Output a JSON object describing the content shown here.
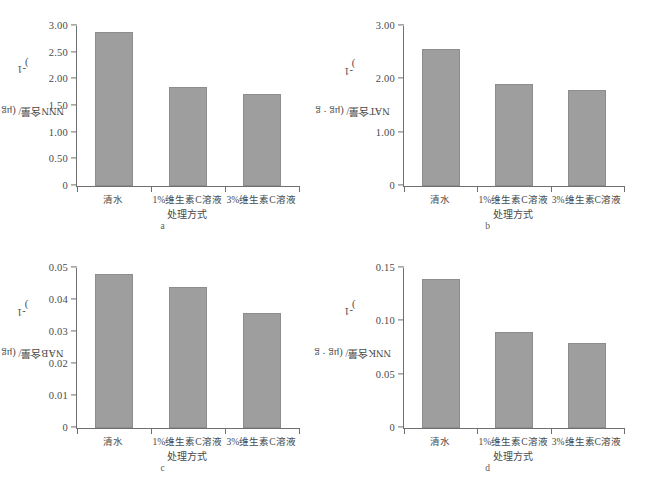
{
  "figure": {
    "caption": "",
    "bar_color": "#9e9e9e",
    "axis_color": "#6f6f6f",
    "panels": [
      {
        "letter": "a",
        "ylabel": "NNN含量/ (μg · g",
        "ylabel_sup": "-1",
        "ylabel_close": ")",
        "xtitle": "处理方式"
      },
      {
        "letter": "b",
        "ylabel": "NAT含量/ (μg · g",
        "ylabel_sup": "-1",
        "ylabel_close": ")",
        "xtitle": "处理方式"
      },
      {
        "letter": "c",
        "ylabel": "NAB含量/ (μg · g",
        "ylabel_sup": "-1",
        "ylabel_close": ")",
        "xtitle": "处理方式"
      },
      {
        "letter": "d",
        "ylabel": "NNK含量/ (μg · g",
        "ylabel_sup": "-1",
        "ylabel_close": ")",
        "xtitle": "处理方式"
      }
    ]
  },
  "chart_data": [
    {
      "type": "bar",
      "panel": "a",
      "title": "",
      "xlabel": "处理方式",
      "ylabel": "NNN含量/ (μg · g-1)",
      "categories": [
        "清水",
        "1%维生素C溶液",
        "3%维生素C溶液"
      ],
      "values": [
        2.89,
        1.85,
        1.72
      ],
      "ylim": [
        0,
        3.0
      ],
      "yticks": [
        0,
        0.5,
        1.0,
        1.5,
        2.0,
        2.5,
        3.0
      ],
      "ytick_labels": [
        "0",
        "0.50",
        "1.00",
        "1.50",
        "2.00",
        "2.50",
        "3.00"
      ],
      "grid": false,
      "legend": false
    },
    {
      "type": "bar",
      "panel": "b",
      "title": "",
      "xlabel": "处理方式",
      "ylabel": "NAT含量/ (μg · g-1)",
      "categories": [
        "清水",
        "1%维生素C溶液",
        "3%维生素C溶液"
      ],
      "values": [
        2.56,
        1.92,
        1.8
      ],
      "ylim": [
        0,
        3.0
      ],
      "yticks": [
        0,
        1.0,
        2.0,
        3.0
      ],
      "ytick_labels": [
        "0",
        "1.00",
        "2.00",
        "3.00"
      ],
      "grid": false,
      "legend": false
    },
    {
      "type": "bar",
      "panel": "c",
      "title": "",
      "xlabel": "处理方式",
      "ylabel": "NAB含量/ (μg · g-1)",
      "categories": [
        "清水",
        "1%维生素C溶液",
        "3%维生素C溶液"
      ],
      "values": [
        0.048,
        0.044,
        0.036
      ],
      "ylim": [
        0,
        0.05
      ],
      "yticks": [
        0,
        0.01,
        0.02,
        0.03,
        0.04,
        0.05
      ],
      "ytick_labels": [
        "0",
        "0.01",
        "0.02",
        "0.03",
        "0.04",
        "0.05"
      ],
      "grid": false,
      "legend": false
    },
    {
      "type": "bar",
      "panel": "d",
      "title": "",
      "xlabel": "处理方式",
      "ylabel": "NNK含量/ (μg · g-1)",
      "categories": [
        "清水",
        "1%维生素C溶液",
        "3%维生素C溶液"
      ],
      "values": [
        0.14,
        0.09,
        0.08
      ],
      "ylim": [
        0,
        0.15
      ],
      "yticks": [
        0,
        0.05,
        0.1,
        0.15
      ],
      "ytick_labels": [
        "0",
        "0.05",
        "0.10",
        "0.15"
      ],
      "grid": false,
      "legend": false
    }
  ]
}
